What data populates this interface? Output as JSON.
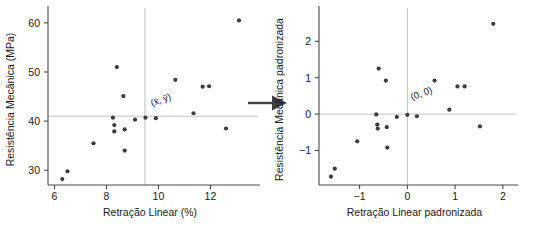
{
  "figure": {
    "arrow_icon": "right-arrow-icon",
    "background": "#ffffff",
    "point_color": "#3d3d42",
    "axis_color": "#4a4a4a",
    "reference_line_color": "#b9b9b9"
  },
  "chart_data": [
    {
      "type": "scatter",
      "title": "",
      "panel": "left",
      "xlabel": "Retração Linear (%)",
      "ylabel": "Resistência Mecânica (MPa)",
      "xlim": [
        5.75,
        13.6
      ],
      "ylim": [
        27.0,
        61.8
      ],
      "xticks": [
        6,
        8,
        10,
        12
      ],
      "xticklabels": [
        "6",
        "8",
        "10",
        "12"
      ],
      "yticks": [
        30,
        40,
        50,
        60
      ],
      "yticklabels": [
        "30",
        "40",
        "50",
        "60"
      ],
      "grid": false,
      "legend": null,
      "reference_lines": {
        "vertical_x": 9.48,
        "horizontal_y": 41.0
      },
      "annotations": [
        {
          "text": "(x̄, ȳ)",
          "x": 9.75,
          "y": 43.0,
          "rotation": -20
        }
      ],
      "x": [
        6.3,
        6.5,
        7.5,
        8.25,
        8.3,
        8.3,
        8.4,
        8.65,
        8.7,
        8.7,
        9.1,
        9.5,
        9.9,
        10.65,
        11.35,
        11.7,
        11.95,
        12.6,
        13.1
      ],
      "y": [
        28.2,
        29.8,
        35.5,
        40.7,
        39.2,
        37.9,
        51.0,
        45.1,
        38.3,
        34.0,
        40.3,
        40.7,
        40.6,
        48.4,
        41.6,
        47.0,
        47.1,
        38.5,
        60.5
      ]
    },
    {
      "type": "scatter",
      "title": "",
      "panel": "right",
      "xlabel": "Retração Linear padronizada",
      "ylabel": "Resistência Mecânica padronizada",
      "xlim": [
        -1.85,
        2.15
      ],
      "ylim": [
        -1.95,
        2.75
      ],
      "xticks": [
        -1,
        0,
        1,
        2
      ],
      "xticklabels": [
        "−1",
        "0",
        "1",
        "2"
      ],
      "yticks": [
        -1,
        0,
        1,
        2
      ],
      "yticklabels": [
        "−1",
        "0",
        "1",
        "2"
      ],
      "grid": false,
      "legend": null,
      "reference_lines": {
        "vertical_x": 0,
        "horizontal_y": 0
      },
      "annotations": [
        {
          "text": "(0, 0)",
          "x": 0.1,
          "y": 0.38,
          "rotation": -20
        }
      ],
      "x": [
        -1.6,
        -1.52,
        -1.05,
        -0.65,
        -0.63,
        -0.62,
        -0.6,
        -0.45,
        -0.43,
        -0.42,
        -0.22,
        0.0,
        0.2,
        0.57,
        0.88,
        1.05,
        1.2,
        1.52,
        1.8
      ],
      "y": [
        -1.72,
        -1.5,
        -0.75,
        -0.01,
        -0.29,
        -0.4,
        1.25,
        0.92,
        -0.36,
        -0.92,
        -0.08,
        -0.02,
        -0.06,
        0.92,
        0.12,
        0.76,
        0.76,
        -0.34,
        2.48
      ]
    }
  ]
}
